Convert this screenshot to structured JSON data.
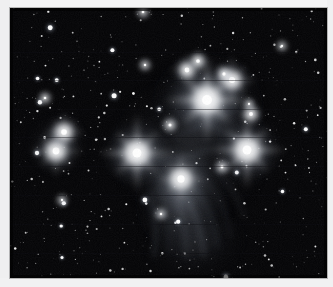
{
  "document": {
    "kind": "astronomical-photograph",
    "subject_label": "",
    "caption": ""
  },
  "figure": {
    "name": "pleiades-star-cluster-photo",
    "frame": {
      "x": 10,
      "y": 8,
      "width": 317,
      "height": 270
    },
    "palette": {
      "background": "#fdfdfd",
      "margin": "#f0f0f1",
      "sky": "#030305",
      "sky_deep": "#000000",
      "star_core": "#ffffff",
      "star_halo": "#dfe4ee",
      "nebula": "#a9b4c6",
      "nebula_dim": "#5d6676",
      "spike": "#cfd6e2",
      "scanline": "#0a0a0e"
    },
    "rendering": {
      "monochrome": true,
      "diffraction_spikes": true,
      "spike_angles_deg": [
        0,
        45,
        90,
        135
      ],
      "scanline_artifacts": true,
      "noise_grain": true
    },
    "bright_stars": [
      {
        "name": "alcyone",
        "cx": 197,
        "cy": 92,
        "r": 9.5,
        "glow": 46,
        "spike": 44,
        "mag": 1.0
      },
      {
        "name": "atlas",
        "cx": 237,
        "cy": 142,
        "r": 8.5,
        "glow": 40,
        "spike": 40,
        "mag": 0.94
      },
      {
        "name": "maia",
        "cx": 127,
        "cy": 145,
        "r": 8.5,
        "glow": 40,
        "spike": 40,
        "mag": 0.94
      },
      {
        "name": "merope",
        "cx": 171,
        "cy": 171,
        "r": 7.0,
        "glow": 40,
        "spike": 26,
        "mag": 0.86
      },
      {
        "name": "electra",
        "cx": 46,
        "cy": 143,
        "r": 6.5,
        "glow": 27,
        "spike": 27,
        "mag": 0.82
      },
      {
        "name": "taygeta",
        "cx": 54,
        "cy": 124,
        "r": 5.4,
        "glow": 22,
        "spike": 21,
        "mag": 0.76
      },
      {
        "name": "pleione",
        "cx": 222,
        "cy": 72,
        "r": 5.8,
        "glow": 24,
        "spike": 26,
        "mag": 0.8
      },
      {
        "name": "asterope",
        "cx": 177,
        "cy": 62,
        "r": 4.6,
        "glow": 19,
        "spike": 18,
        "mag": 0.72
      },
      {
        "name": "celaeno",
        "cx": 188,
        "cy": 53,
        "r": 3.6,
        "glow": 15,
        "spike": 13,
        "mag": 0.66
      },
      {
        "name": "star-hd23753",
        "cx": 241,
        "cy": 106,
        "r": 3.8,
        "glow": 16,
        "spike": 14,
        "mag": 0.68
      },
      {
        "name": "star-hd23630",
        "cx": 214,
        "cy": 66,
        "r": 3.2,
        "glow": 13,
        "spike": 11,
        "mag": 0.62
      },
      {
        "name": "star-hd23324",
        "cx": 160,
        "cy": 117,
        "r": 3.0,
        "glow": 12,
        "spike": 10,
        "mag": 0.6
      },
      {
        "name": "star-hd23512",
        "cx": 212,
        "cy": 159,
        "r": 2.8,
        "glow": 12,
        "spike": 10,
        "mag": 0.58
      },
      {
        "name": "star-lower-a",
        "cx": 151,
        "cy": 206,
        "r": 2.4,
        "glow": 10,
        "spike": 8,
        "mag": 0.54
      },
      {
        "name": "star-left-b",
        "cx": 35,
        "cy": 90,
        "r": 2.6,
        "glow": 10,
        "spike": 9,
        "mag": 0.56
      },
      {
        "name": "star-top-c",
        "cx": 135,
        "cy": 57,
        "r": 2.4,
        "glow": 10,
        "spike": 8,
        "mag": 0.54
      },
      {
        "name": "star-top-d",
        "cx": 133,
        "cy": 4,
        "r": 2.6,
        "glow": 10,
        "spike": 9,
        "mag": 0.55
      },
      {
        "name": "star-right-e",
        "cx": 272,
        "cy": 38,
        "r": 2.2,
        "glow": 9,
        "spike": 8,
        "mag": 0.52
      },
      {
        "name": "star-mid-f",
        "cx": 239,
        "cy": 96,
        "r": 2.2,
        "glow": 9,
        "spike": 8,
        "mag": 0.52
      },
      {
        "name": "star-bl-g",
        "cx": 52,
        "cy": 192,
        "r": 2.2,
        "glow": 9,
        "spike": 8,
        "mag": 0.52
      }
    ],
    "nebulae": [
      {
        "name": "merope-nebula",
        "cx": 172,
        "cy": 196,
        "rx": 46,
        "ry": 58,
        "rot": -18,
        "opacity": 0.46
      },
      {
        "name": "alcyone-nebula",
        "cx": 198,
        "cy": 94,
        "rx": 58,
        "ry": 50,
        "rot": 10,
        "opacity": 0.36
      },
      {
        "name": "maia-nebula",
        "cx": 128,
        "cy": 148,
        "rx": 34,
        "ry": 28,
        "rot": 0,
        "opacity": 0.28
      },
      {
        "name": "atlas-nebula",
        "cx": 238,
        "cy": 144,
        "rx": 30,
        "ry": 26,
        "rot": 0,
        "opacity": 0.26
      },
      {
        "name": "electra-nebula",
        "cx": 48,
        "cy": 137,
        "rx": 30,
        "ry": 30,
        "rot": 0,
        "opacity": 0.22
      },
      {
        "name": "central-veil",
        "cx": 180,
        "cy": 140,
        "rx": 86,
        "ry": 82,
        "rot": 0,
        "opacity": 0.18
      },
      {
        "name": "lower-wash",
        "cx": 185,
        "cy": 236,
        "rx": 54,
        "ry": 36,
        "rot": -10,
        "opacity": 0.16
      }
    ],
    "nebula_striations": [
      {
        "name": "striation-1",
        "d": "M148,176 C156,196 160,216 158,246"
      },
      {
        "name": "striation-2",
        "d": "M159,172 C170,194 176,218 176,250"
      },
      {
        "name": "striation-3",
        "d": "M172,181 C184,200 192,222 194,248"
      },
      {
        "name": "striation-4",
        "d": "M184,178 C198,196 206,216 208,240"
      },
      {
        "name": "striation-5",
        "d": "M196,172 C210,188 218,206 220,228"
      },
      {
        "name": "striation-6",
        "d": "M140,186 C145,206 147,226 144,248"
      },
      {
        "name": "striation-7",
        "d": "M205,162 C220,176 230,192 234,210"
      },
      {
        "name": "striation-8",
        "d": "M130,150 C150,154 175,152 198,142"
      },
      {
        "name": "striation-9",
        "d": "M200,118 C218,126 236,134 250,146"
      },
      {
        "name": "striation-10",
        "d": "M166,128 C188,120 212,110 230,96"
      }
    ],
    "field_star_count": 520,
    "scanline_rows": [
      44,
      72,
      101,
      129,
      158,
      187,
      216,
      245
    ]
  }
}
